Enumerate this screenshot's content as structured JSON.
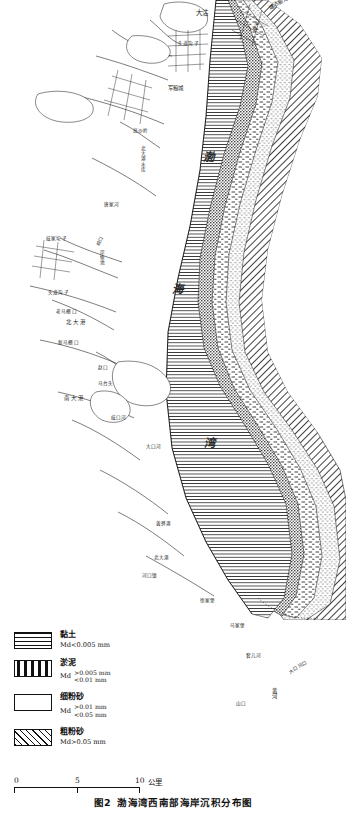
{
  "figure": {
    "number": "图2",
    "title": "渤海湾西南部海岸沉积分布图"
  },
  "map": {
    "water_body": {
      "chars": [
        "渤",
        "海",
        "湾"
      ],
      "full": "渤海湾"
    },
    "place_labels": [
      {
        "text": "大沽",
        "x": 196,
        "y": 10,
        "size": "md"
      },
      {
        "text": "塘沽新港",
        "x": 268,
        "y": 4,
        "size": "sm",
        "rotate": -28
      },
      {
        "text": "海河",
        "x": 252,
        "y": 30,
        "size": "xs",
        "rotate": -55
      },
      {
        "text": "头道沟子",
        "x": 182,
        "y": 42,
        "size": "xs"
      },
      {
        "text": "军粮城",
        "x": 172,
        "y": 86,
        "size": "sm"
      },
      {
        "text": "高沙岭",
        "x": 135,
        "y": 130,
        "size": "xs"
      },
      {
        "text": "北大港水库",
        "x": 140,
        "y": 148,
        "size": "xs",
        "vertical": true
      },
      {
        "text": "唐家河",
        "x": 106,
        "y": 204,
        "size": "xs"
      },
      {
        "text": "歧家坨子",
        "x": 48,
        "y": 238,
        "size": "xs"
      },
      {
        "text": "歧口",
        "x": 96,
        "y": 246,
        "size": "xs",
        "rotate": -60
      },
      {
        "text": "岸鱼池",
        "x": 100,
        "y": 252,
        "size": "xs",
        "vertical": true
      },
      {
        "text": "头道沟子",
        "x": 52,
        "y": 292,
        "size": "xs"
      },
      {
        "text": "老马棚口",
        "x": 60,
        "y": 311,
        "size": "xs"
      },
      {
        "text": "北大港",
        "x": 70,
        "y": 320,
        "size": "sm"
      },
      {
        "text": "新马棚口",
        "x": 62,
        "y": 342,
        "size": "xs"
      },
      {
        "text": "赵口",
        "x": 100,
        "y": 367,
        "size": "xs"
      },
      {
        "text": "马台头",
        "x": 100,
        "y": 383,
        "size": "xs"
      },
      {
        "text": "南大港",
        "x": 68,
        "y": 396,
        "size": "sm"
      },
      {
        "text": "歧口河",
        "x": 113,
        "y": 417,
        "size": "xs"
      },
      {
        "text": "大口河",
        "x": 148,
        "y": 446,
        "size": "xs"
      },
      {
        "text": "黄骅港",
        "x": 160,
        "y": 523,
        "size": "xs"
      },
      {
        "text": "北大港",
        "x": 158,
        "y": 557,
        "size": "xs"
      },
      {
        "text": "河口镇",
        "x": 146,
        "y": 575,
        "size": "xs"
      },
      {
        "text": "徐家堡",
        "x": 203,
        "y": 600,
        "size": "xs"
      },
      {
        "text": "马家堡",
        "x": 232,
        "y": 625,
        "size": "xs"
      },
      {
        "text": "套儿河",
        "x": 248,
        "y": 655,
        "size": "xs"
      },
      {
        "text": "大口河口",
        "x": 290,
        "y": 672,
        "size": "xs",
        "rotate": -30
      },
      {
        "text": "黄河",
        "x": 272,
        "y": 690,
        "size": "sm",
        "vertical": true
      },
      {
        "text": "山口",
        "x": 238,
        "y": 703,
        "size": "xs"
      }
    ]
  },
  "legend": {
    "items": [
      {
        "pattern": "clay",
        "name": "黏土",
        "spec_single": "Md<0.005 mm",
        "spec_upper": "",
        "spec_lower": ""
      },
      {
        "pattern": "silt",
        "name": "淤泥",
        "spec_single": "",
        "spec_prefix": "Md",
        "spec_upper": ">0.005 mm",
        "spec_lower": "<0.01 mm"
      },
      {
        "pattern": "fine",
        "name": "细粉砂",
        "spec_single": "",
        "spec_prefix": "Md",
        "spec_upper": ">0.01 mm",
        "spec_lower": "<0.05 mm"
      },
      {
        "pattern": "coarse",
        "name": "粗粉砂",
        "spec_single": "Md>0.05 mm",
        "spec_upper": "",
        "spec_lower": ""
      }
    ]
  },
  "scalebar": {
    "ticks": [
      "0",
      "5",
      "10"
    ],
    "unit": "公里"
  }
}
